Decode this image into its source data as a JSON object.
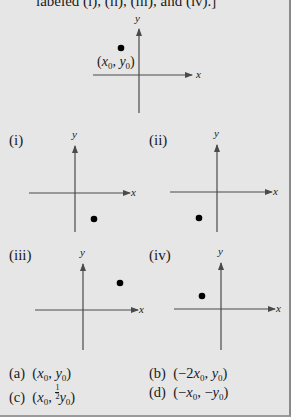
{
  "caption": "labeled (i), (ii), (iii), and (iv).]",
  "main_graph": {
    "point_label_x": "x",
    "point_label_y": "y",
    "point_label_sub": "0",
    "axis_x": "x",
    "axis_y": "y"
  },
  "panels": [
    {
      "label": "(i)",
      "axis_x": "x",
      "axis_y": "y",
      "quadrant": "IV"
    },
    {
      "label": "(ii)",
      "axis_x": "x",
      "axis_y": "y",
      "quadrant": "III"
    },
    {
      "label": "(iii)",
      "axis_x": "x",
      "axis_y": "y",
      "quadrant": "I"
    },
    {
      "label": "(iv)",
      "axis_x": "x",
      "axis_y": "y",
      "quadrant": "II"
    }
  ],
  "answers": [
    {
      "letter": "(a)",
      "expr": "(x0, y0)"
    },
    {
      "letter": "(b)",
      "expr": "(−2x0, y0)"
    },
    {
      "letter": "(c)",
      "expr": "(x0, ½y0)"
    },
    {
      "letter": "(d)",
      "expr": "(−x0, −y0)"
    }
  ],
  "colors": {
    "background": "#e6e6e6",
    "axis": "#4a4a4a",
    "point": "#000000"
  }
}
